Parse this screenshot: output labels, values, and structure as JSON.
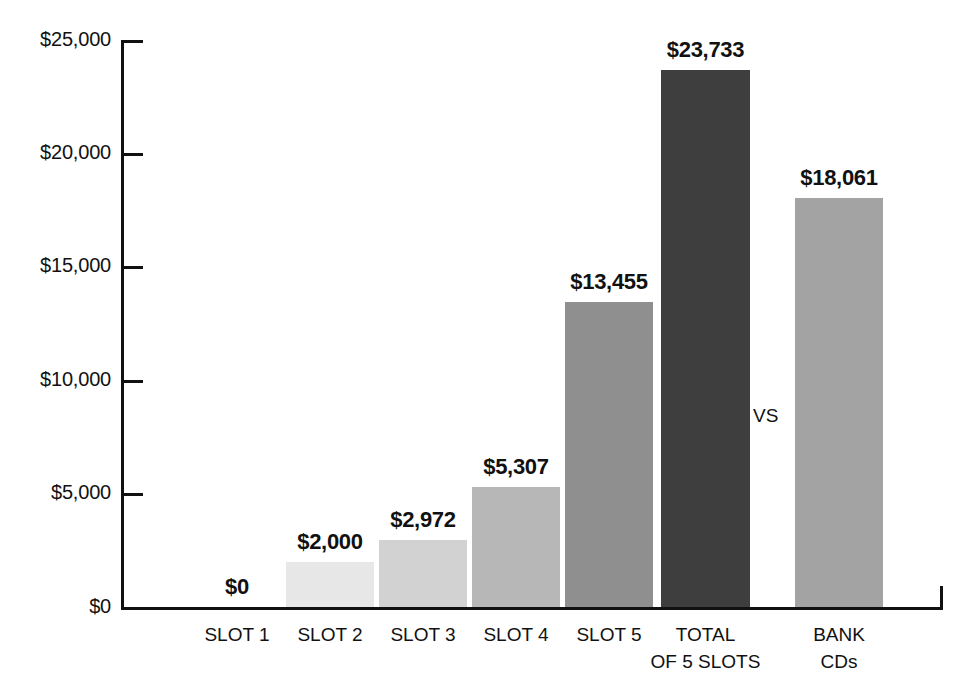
{
  "chart_data": {
    "type": "bar",
    "title": "",
    "subtitle": "",
    "xlabel": "",
    "ylabel": "",
    "categories": [
      "SLOT 1",
      "SLOT 2",
      "SLOT 3",
      "SLOT 4",
      "SLOT 5",
      "TOTAL OF 5 SLOTS",
      "BANK CDs"
    ],
    "values": [
      0,
      2000,
      2972,
      5307,
      13455,
      23733,
      18061
    ],
    "value_labels": [
      "$0",
      "$2,000",
      "$2,972",
      "$5,307",
      "$13,455",
      "$23,733",
      "$18,061"
    ],
    "ylim": [
      0,
      25000
    ],
    "y_ticks": [
      0,
      5000,
      10000,
      15000,
      20000,
      25000
    ],
    "y_tick_labels": [
      "$0",
      "$5,000",
      "$10,000",
      "$15,000",
      "$20,000",
      "$25,000"
    ],
    "grid": false,
    "legend": "none",
    "annotations": [
      {
        "text": "VS",
        "between": [
          "TOTAL OF 5 SLOTS",
          "BANK CDs"
        ]
      }
    ],
    "bar_colors": [
      "#ffffff",
      "#e7e7e7",
      "#d2d2d2",
      "#b7b7b7",
      "#8f8f8f",
      "#3e3e3e",
      "#a3a3a3"
    ]
  },
  "axis": {
    "ticks": [
      {
        "label": "$25,000",
        "value": 25000
      },
      {
        "label": "$20,000",
        "value": 20000
      },
      {
        "label": "$15,000",
        "value": 15000
      },
      {
        "label": "$10,000",
        "value": 10000
      },
      {
        "label": "$5,000",
        "value": 5000
      },
      {
        "label": "$0",
        "value": 0
      }
    ]
  },
  "categories": [
    {
      "line1": "SLOT 1",
      "line2": ""
    },
    {
      "line1": "SLOT 2",
      "line2": ""
    },
    {
      "line1": "SLOT 3",
      "line2": ""
    },
    {
      "line1": "SLOT 4",
      "line2": ""
    },
    {
      "line1": "SLOT 5",
      "line2": ""
    },
    {
      "line1": "TOTAL",
      "line2": "OF 5 SLOTS"
    },
    {
      "line1": "BANK",
      "line2": "CDs"
    }
  ],
  "bars": [
    {
      "label": "$0",
      "value": 0
    },
    {
      "label": "$2,000",
      "value": 2000
    },
    {
      "label": "$2,972",
      "value": 2972
    },
    {
      "label": "$5,307",
      "value": 5307
    },
    {
      "label": "$13,455",
      "value": 13455
    },
    {
      "label": "$23,733",
      "value": 23733
    },
    {
      "label": "$18,061",
      "value": 18061
    }
  ],
  "annotation": {
    "vs": "VS"
  }
}
